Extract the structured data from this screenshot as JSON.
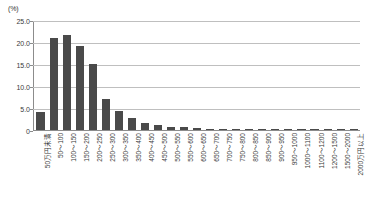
{
  "chart_data": {
    "type": "bar",
    "title": "",
    "subtitle": "",
    "xlabel": "",
    "ylabel": "(%)",
    "ylim": [
      0,
      25.0
    ],
    "yticks": [
      "25.0",
      "20.0",
      "15.0",
      "10.0",
      "5.0",
      "0"
    ],
    "ytick_values": [
      25.0,
      20.0,
      15.0,
      10.0,
      5.0,
      0
    ],
    "grid": true,
    "legend": null,
    "legend_position": "none",
    "bar_color": "#4a4a4a",
    "grid_color": "#bfbfbf",
    "axis_color": "#8c8c8c",
    "categories": [
      "50万円未満",
      "50～100",
      "100～150",
      "150～200",
      "200～250",
      "250～300",
      "300～350",
      "350～400",
      "400～450",
      "450～500",
      "500～550",
      "550～600",
      "600～650",
      "650～700",
      "700～750",
      "750～800",
      "800～850",
      "850～900",
      "900～950",
      "950～1000",
      "1000～1100",
      "1100～1200",
      "1200～1500",
      "1500～2000",
      "2000万円以上"
    ],
    "values": [
      4.0,
      21.0,
      21.6,
      19.0,
      14.9,
      7.0,
      4.4,
      2.8,
      1.5,
      1.1,
      0.7,
      0.6,
      0.4,
      0.3,
      0.25,
      0.2,
      0.2,
      0.15,
      0.15,
      0.1,
      0.15,
      0.1,
      0.1,
      0.1,
      0.1
    ]
  }
}
